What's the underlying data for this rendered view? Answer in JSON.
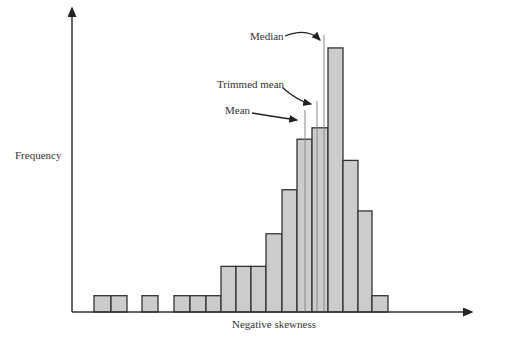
{
  "chart_data": {
    "type": "bar",
    "title": "",
    "xlabel": "Negative skewness",
    "ylabel": "Frequency",
    "grid": false,
    "bar_color": "#cccccc",
    "bins": [
      {
        "x0": 94,
        "x1": 111,
        "value": 1
      },
      {
        "x0": 111,
        "x1": 127,
        "value": 1
      },
      {
        "x0": 127,
        "x1": 142,
        "value": 0
      },
      {
        "x0": 142,
        "x1": 158,
        "value": 1
      },
      {
        "x0": 158,
        "x1": 174,
        "value": 0
      },
      {
        "x0": 174,
        "x1": 190,
        "value": 1
      },
      {
        "x0": 190,
        "x1": 206,
        "value": 1
      },
      {
        "x0": 206,
        "x1": 221,
        "value": 1
      },
      {
        "x0": 221,
        "x1": 236,
        "value": 2.8
      },
      {
        "x0": 236,
        "x1": 251,
        "value": 2.8
      },
      {
        "x0": 251,
        "x1": 266,
        "value": 2.8
      },
      {
        "x0": 266,
        "x1": 282,
        "value": 4.8
      },
      {
        "x0": 282,
        "x1": 297,
        "value": 7.5
      },
      {
        "x0": 297,
        "x1": 312,
        "value": 10.6
      },
      {
        "x0": 312,
        "x1": 328,
        "value": 11.3
      },
      {
        "x0": 328,
        "x1": 343,
        "value": 16.2
      },
      {
        "x0": 343,
        "x1": 358,
        "value": 9.3
      },
      {
        "x0": 358,
        "x1": 372,
        "value": 6.2
      },
      {
        "x0": 372,
        "x1": 388,
        "value": 1
      }
    ],
    "annotations": [
      {
        "label": "Median",
        "x": 324
      },
      {
        "label": "Trimmed mean",
        "x": 317
      },
      {
        "label": "Mean",
        "x": 305
      }
    ]
  },
  "labels": {
    "ylabel": "Frequency",
    "xlabel": "Negative skewness",
    "median": "Median",
    "trimmed_mean": "Trimmed mean",
    "mean": "Mean"
  }
}
